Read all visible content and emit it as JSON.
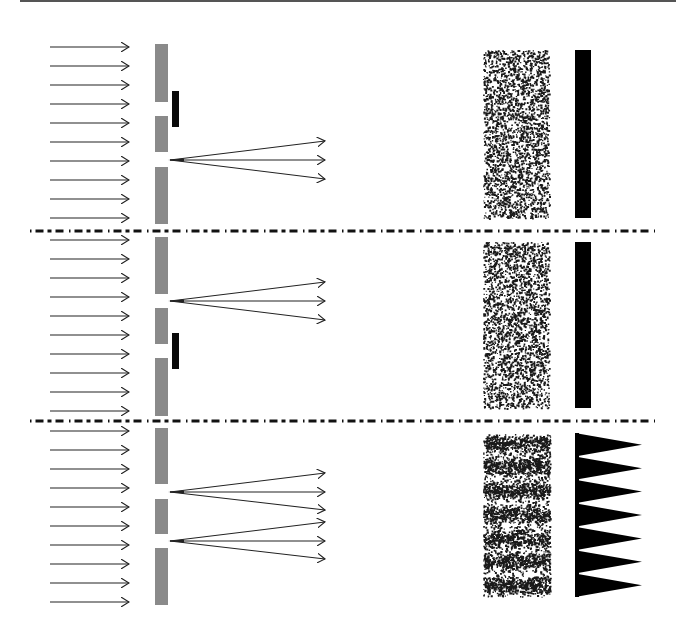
{
  "title": "Which-slit experiment: single-slit blocked vs. both slits open",
  "colors": {
    "background": "#ffffff",
    "rule": "#555555",
    "arrow": "#222222",
    "wall": "#8a8a8a",
    "blocker": "#0a0a0a",
    "speckle": "#1a1a1a",
    "detector": "#000000",
    "separator": "#111111"
  },
  "top_rule": {
    "x1": 20,
    "x2": 676,
    "y": 1
  },
  "incident_arrows": {
    "x1": 50,
    "x2": 129,
    "head": 7
  },
  "wall": {
    "x": 155,
    "width": 13
  },
  "separators": [
    {
      "y": 231,
      "x1": 30,
      "x2": 655
    },
    {
      "y": 421,
      "x1": 30,
      "x2": 655
    }
  ],
  "panels": [
    {
      "name": "panel-top-upper-slit-blocked",
      "label": "Upper slit blocked",
      "arrow_ys": [
        47,
        66,
        85,
        104,
        123,
        142,
        161,
        180,
        199,
        218
      ],
      "wall_segments": [
        [
          44,
          102
        ],
        [
          116,
          152
        ],
        [
          167,
          224
        ]
      ],
      "blocker": {
        "x": 172,
        "y": 91,
        "w": 7,
        "h": 36
      },
      "fans": [
        {
          "ox": 170,
          "oy": 160,
          "ends": [
            [
              325,
              141
            ],
            [
              325,
              160
            ],
            [
              325,
              179
            ]
          ]
        }
      ],
      "screen": {
        "x": 483,
        "y": 50,
        "w": 66,
        "h": 168,
        "pattern": "uniform",
        "density": 2600,
        "seed": 11
      },
      "intensity": {
        "type": "bar",
        "x": 575,
        "y": 50,
        "w": 16,
        "h": 168
      }
    },
    {
      "name": "panel-middle-lower-slit-blocked",
      "label": "Lower slit blocked",
      "arrow_ys": [
        240,
        259,
        278,
        297,
        316,
        335,
        354,
        373,
        392,
        411
      ],
      "wall_segments": [
        [
          237,
          294
        ],
        [
          308,
          344
        ],
        [
          358,
          416
        ]
      ],
      "blocker": {
        "x": 172,
        "y": 333,
        "w": 7,
        "h": 36
      },
      "fans": [
        {
          "ox": 170,
          "oy": 301,
          "ends": [
            [
              325,
              282
            ],
            [
              325,
              301
            ],
            [
              325,
              320
            ]
          ]
        }
      ],
      "screen": {
        "x": 483,
        "y": 242,
        "w": 66,
        "h": 166,
        "pattern": "uniform",
        "density": 2600,
        "seed": 37
      },
      "intensity": {
        "type": "bar",
        "x": 575,
        "y": 242,
        "w": 16,
        "h": 166
      }
    },
    {
      "name": "panel-bottom-both-slits-open",
      "label": "Both slits open",
      "arrow_ys": [
        431,
        450,
        469,
        488,
        507,
        526,
        545,
        564,
        583,
        602
      ],
      "wall_segments": [
        [
          428,
          484
        ],
        [
          499,
          534
        ],
        [
          548,
          605
        ]
      ],
      "blocker": null,
      "fans": [
        {
          "ox": 170,
          "oy": 492,
          "ends": [
            [
              325,
              473
            ],
            [
              325,
              492
            ],
            [
              325,
              510
            ]
          ]
        },
        {
          "ox": 170,
          "oy": 541,
          "ends": [
            [
              325,
              522
            ],
            [
              325,
              541
            ],
            [
              325,
              559
            ]
          ]
        }
      ],
      "screen": {
        "x": 483,
        "y": 434,
        "w": 67,
        "h": 163,
        "pattern": "fringes",
        "fringe_count": 7,
        "fringe_centers": [
          443,
          466,
          490,
          514,
          538,
          561,
          585
        ],
        "fringe_sigma": 5.5,
        "density": 4200,
        "seed": 73
      },
      "intensity": {
        "type": "comb",
        "x": 575,
        "y": 433,
        "h": 164,
        "teeth": 7,
        "tip_x": 642,
        "base_w": 4
      }
    }
  ]
}
